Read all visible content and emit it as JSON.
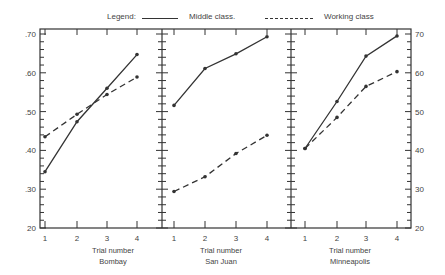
{
  "legend": {
    "title": "Legend:",
    "middle_label": "Middle class.",
    "working_label": "Working class"
  },
  "axes": {
    "left_ticks": [
      ".70",
      ".60",
      ".50",
      ".40",
      ".30",
      "20"
    ],
    "right_ticks": [
      "70",
      "60",
      "50",
      "40",
      "30",
      "20"
    ],
    "x_ticks": [
      "1",
      "2",
      "3",
      "4"
    ],
    "xlabel": "Trial number"
  },
  "panels": [
    {
      "name": "Bombay"
    },
    {
      "name": "San Juan"
    },
    {
      "name": "Minneapolis"
    }
  ],
  "chart_data": {
    "type": "line",
    "title": "",
    "legend": [
      "Middle class.",
      "Working class"
    ],
    "legend_position": "top",
    "ylim": [
      0.2,
      0.7
    ],
    "yticks": [
      0.2,
      0.3,
      0.4,
      0.5,
      0.6,
      0.7
    ],
    "grid": false,
    "panels": [
      {
        "subtitle": "Bombay",
        "xlabel": "Trial number",
        "x": [
          1,
          2,
          3,
          4
        ],
        "series": [
          {
            "name": "Middle class",
            "style": "solid",
            "values": [
              0.345,
              0.474,
              0.56,
              0.647
            ]
          },
          {
            "name": "Working class",
            "style": "dashed",
            "values": [
              0.435,
              0.493,
              0.544,
              0.589
            ]
          }
        ]
      },
      {
        "subtitle": "San Juan",
        "xlabel": "Trial number",
        "x": [
          1,
          2,
          3,
          4
        ],
        "series": [
          {
            "name": "Middle class",
            "style": "solid",
            "values": [
              0.516,
              0.611,
              0.649,
              0.693
            ]
          },
          {
            "name": "Working class",
            "style": "dashed",
            "values": [
              0.294,
              0.332,
              0.392,
              0.439
            ]
          }
        ]
      },
      {
        "subtitle": "Minneapolis",
        "xlabel": "Trial number",
        "x": [
          1,
          2,
          3,
          4
        ],
        "series": [
          {
            "name": "Middle class",
            "style": "solid",
            "values": [
              0.405,
              0.526,
              0.643,
              0.695
            ]
          },
          {
            "name": "Working class",
            "style": "dashed",
            "values": [
              0.405,
              0.485,
              0.565,
              0.603
            ]
          }
        ]
      }
    ]
  }
}
